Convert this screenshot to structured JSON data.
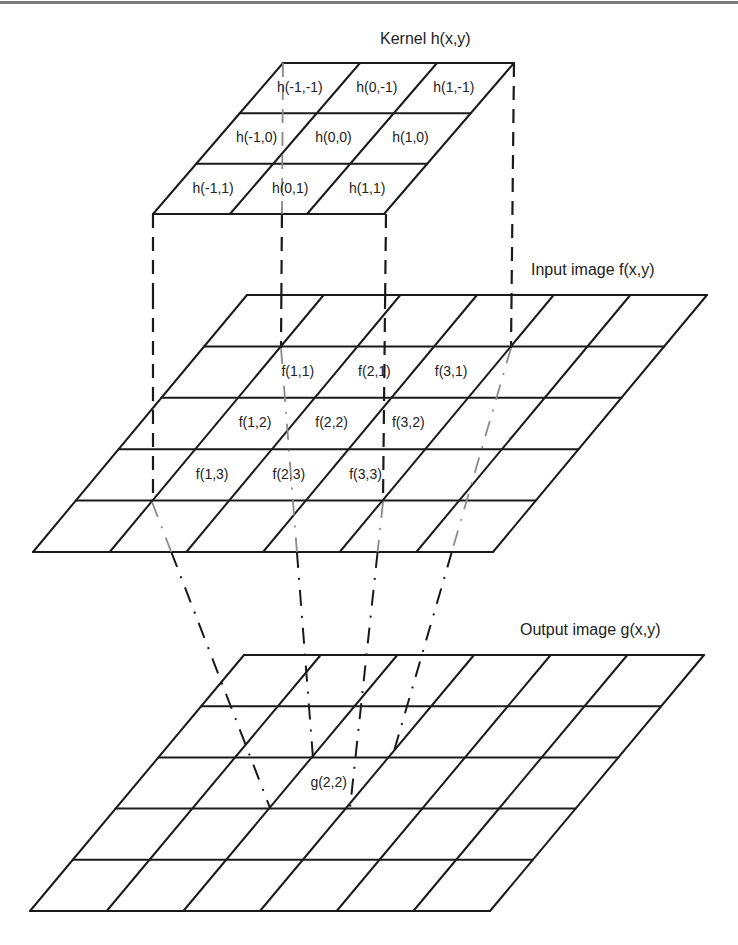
{
  "colors": {
    "line": "#1a1a1a",
    "hidden_line": "#8a8a8a",
    "text": "#222222",
    "background": "#ffffff",
    "top_rule": "#7a7a7a"
  },
  "layers": [
    {
      "id": "kernel",
      "title": "Kernel h(x,y)",
      "title_pos": [
        380,
        44
      ],
      "rows": 3,
      "cols": 3,
      "top_left": [
        283,
        63
      ],
      "top_right": [
        514,
        63
      ],
      "bottom_left": [
        153,
        214
      ],
      "cells": [
        {
          "row": 0,
          "col": 0,
          "label": "h(-1,-1)"
        },
        {
          "row": 0,
          "col": 1,
          "label": "h(0,-1)"
        },
        {
          "row": 0,
          "col": 2,
          "label": "h(1,-1)"
        },
        {
          "row": 1,
          "col": 0,
          "label": "h(-1,0)"
        },
        {
          "row": 1,
          "col": 1,
          "label": "h(0,0)"
        },
        {
          "row": 1,
          "col": 2,
          "label": "h(1,0)"
        },
        {
          "row": 2,
          "col": 0,
          "label": "h(-1,1)"
        },
        {
          "row": 2,
          "col": 1,
          "label": "h(0,1)"
        },
        {
          "row": 2,
          "col": 2,
          "label": "h(1,1)"
        }
      ]
    },
    {
      "id": "input",
      "title": "Input image f(x,y)",
      "title_pos": [
        531,
        275
      ],
      "rows": 5,
      "cols": 6,
      "top_left": [
        247,
        295
      ],
      "top_right": [
        707,
        295
      ],
      "bottom_left": [
        33,
        552
      ],
      "cells": [
        {
          "row": 1,
          "col": 1,
          "label": "f(1,1)"
        },
        {
          "row": 1,
          "col": 2,
          "label": "f(2,1)"
        },
        {
          "row": 1,
          "col": 3,
          "label": "f(3,1)"
        },
        {
          "row": 2,
          "col": 1,
          "label": "f(1,2)"
        },
        {
          "row": 2,
          "col": 2,
          "label": "f(2,2)"
        },
        {
          "row": 2,
          "col": 3,
          "label": "f(3,2)"
        },
        {
          "row": 3,
          "col": 1,
          "label": "f(1,3)"
        },
        {
          "row": 3,
          "col": 2,
          "label": "f(2,3)"
        },
        {
          "row": 3,
          "col": 3,
          "label": "f(3,3)"
        }
      ]
    },
    {
      "id": "output",
      "title": "Output image g(x,y)",
      "title_pos": [
        520,
        635
      ],
      "rows": 5,
      "cols": 6,
      "top_left": [
        244,
        655
      ],
      "top_right": [
        704,
        655
      ],
      "bottom_left": [
        30,
        911
      ],
      "cells": [
        {
          "row": 2,
          "col": 2,
          "label": "g(2,2)"
        }
      ]
    }
  ],
  "projections": {
    "kernel_to_input": [
      {
        "from": [
          153,
          214
        ],
        "to": [
          153,
          502
        ],
        "style": "dashed",
        "hidden_from": null
      },
      {
        "from": [
          283,
          63
        ],
        "to": [
          281,
          348
        ],
        "style": "dashed",
        "hidden_until": 214
      },
      {
        "from": [
          386,
          214
        ],
        "to": [
          383,
          502
        ],
        "style": "dashed",
        "hidden_from": null
      },
      {
        "from": [
          514,
          63
        ],
        "to": [
          511,
          348
        ],
        "style": "dashed",
        "hidden_from": null
      }
    ],
    "input_to_output": [
      {
        "from": [
          152,
          502
        ],
        "to": [
          270,
          808
        ],
        "style": "dashdot"
      },
      {
        "from": [
          281,
          348
        ],
        "to": [
          313,
          758
        ],
        "style": "dashdot"
      },
      {
        "from": [
          511,
          348
        ],
        "to": [
          392,
          758
        ],
        "style": "dashdot"
      },
      {
        "from": [
          383,
          502
        ],
        "to": [
          350,
          808
        ],
        "style": "dashdot"
      }
    ]
  },
  "text": {
    "kernel_title": "Kernel h(x,y)",
    "input_title": "Input image f(x,y)",
    "output_title": "Output image g(x,y)"
  }
}
